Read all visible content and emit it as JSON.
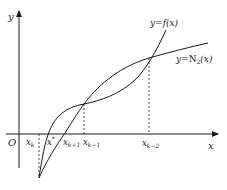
{
  "diagram": {
    "type": "function-approximation-plot",
    "axes": {
      "x_label": "x",
      "y_label": "y",
      "origin_label": "O"
    },
    "curves": [
      {
        "name": "f",
        "label": "y = f(x)",
        "label_main": "y=",
        "label_fn": "f(x)"
      },
      {
        "name": "N2",
        "label": "y = N2(x)",
        "label_main": "y=",
        "label_fn": "N",
        "label_sub": "2",
        "label_arg": "(x)"
      }
    ],
    "x_ticks": [
      {
        "id": "xk",
        "base": "x",
        "sub": "k",
        "dashed": true
      },
      {
        "id": "xstar",
        "base": "x",
        "sup": "*",
        "dashed": false
      },
      {
        "id": "xk1",
        "base": "x",
        "sub": "k+1",
        "dashed": false
      },
      {
        "id": "xkm1",
        "base": "x",
        "sub": "k−1",
        "dashed": true
      },
      {
        "id": "xkm2",
        "base": "x",
        "sub": "k−2",
        "dashed": true
      }
    ],
    "colors": {
      "line": "#1a1a1a",
      "background": "#ffffff"
    }
  }
}
